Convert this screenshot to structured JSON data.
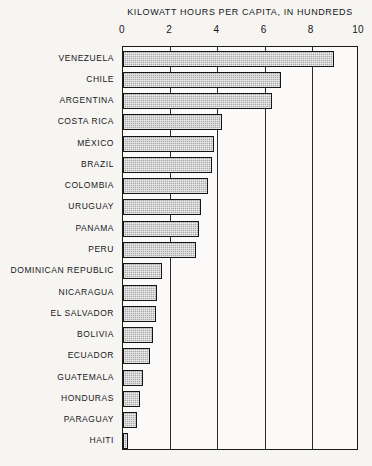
{
  "chart_data": {
    "type": "bar",
    "orientation": "horizontal",
    "title": "KILOWATT  HOURS  PER  CAPITA,  IN  HUNDREDS",
    "xlabel": "",
    "ylabel": "",
    "xlim": [
      0,
      10
    ],
    "xticks": [
      0,
      2,
      4,
      6,
      8,
      10
    ],
    "xticklabels": [
      "0",
      "2",
      "4",
      "6",
      "8",
      "10"
    ],
    "grid": "vertical",
    "legend": "none",
    "categories": [
      "VENEZUELA",
      "CHILE",
      "ARGENTINA",
      "COSTA  RICA",
      "MÉXICO",
      "BRAZIL",
      "COLOMBIA",
      "URUGUAY",
      "PANAMA",
      "PERU",
      "DOMINICAN  REPUBLIC",
      "NICARAGUA",
      "EL SALVADOR",
      "BOLIVIA",
      "ECUADOR",
      "GUATEMALA",
      "HONDURAS",
      "PARAGUAY",
      "HAITI"
    ],
    "values": [
      8.95,
      6.7,
      6.3,
      4.2,
      3.85,
      3.75,
      3.6,
      3.3,
      3.2,
      3.1,
      1.65,
      1.45,
      1.4,
      1.25,
      1.15,
      0.85,
      0.7,
      0.6,
      0.2
    ],
    "colors": {
      "bar_fill": "#a8a8a8",
      "bar_edge": "#16161a",
      "plot_border": "#1a1a1a",
      "gridline": "#2a2a2a",
      "background": "#f6f5f2",
      "text": "#16161a"
    }
  }
}
